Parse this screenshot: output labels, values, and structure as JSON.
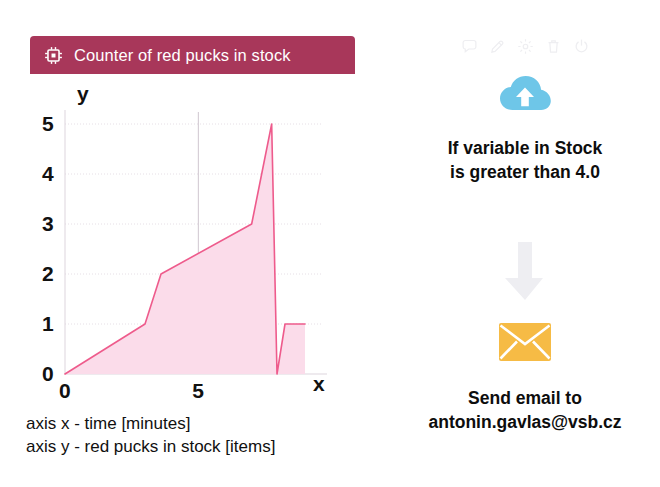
{
  "card": {
    "title": "Counter of red pucks in stock",
    "icon": "chip-icon",
    "header_color": "#a8375a"
  },
  "chart_data": {
    "type": "area",
    "title": "Counter of red pucks in stock",
    "xlabel": "x",
    "ylabel": "y",
    "xlim": [
      0,
      9
    ],
    "ylim": [
      0,
      5
    ],
    "x_ticks": [
      0,
      5
    ],
    "x_tick_labels": [
      "0",
      "5"
    ],
    "y_ticks": [
      0,
      1,
      2,
      3,
      4,
      5
    ],
    "y_tick_labels": [
      "0",
      "1",
      "2",
      "3",
      "4",
      "5"
    ],
    "grid": true,
    "legend": "none",
    "line_color": "#ee5b8c",
    "fill_color": "#fbdcea",
    "series": [
      {
        "name": "red pucks in stock",
        "x": [
          0.0,
          3.0,
          3.6,
          7.0,
          7.75,
          7.95,
          8.25,
          9.0
        ],
        "y": [
          0,
          1,
          2,
          3,
          5,
          0,
          1,
          1
        ]
      }
    ],
    "captions": [
      "axis x - time [minutes]",
      "axis y - red pucks in stock [items]"
    ]
  },
  "axis_labels": {
    "y_letter": "y",
    "x_letter": "x"
  },
  "captions": {
    "line1": "axis x - time [minutes]",
    "line2": "axis y - red pucks in stock [items]"
  },
  "rule_flow": {
    "toolbar": [
      {
        "name": "comment-icon",
        "title": "Comment"
      },
      {
        "name": "edit-icon",
        "title": "Edit"
      },
      {
        "name": "settings-icon",
        "title": "Settings"
      },
      {
        "name": "delete-icon",
        "title": "Delete"
      },
      {
        "name": "power-icon",
        "title": "Power"
      }
    ],
    "trigger": {
      "icon": "cloud-upload-icon",
      "icon_color": "#67c5e8",
      "line1": "If variable in Stock",
      "line2": "is greater than 4.0"
    },
    "connector": {
      "icon": "arrow-down-icon",
      "icon_color": "#e8e8ec"
    },
    "action": {
      "icon": "envelope-icon",
      "icon_color": "#f5b942",
      "line1": "Send email to",
      "line2": "antonin.gavlas@vsb.cz"
    }
  }
}
